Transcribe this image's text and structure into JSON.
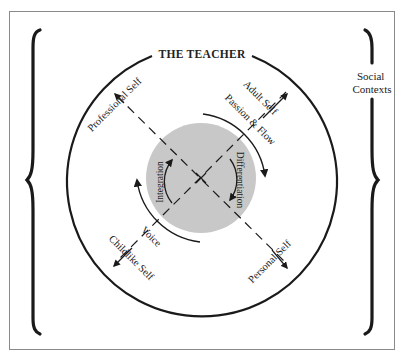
{
  "title": "THE TEACHER",
  "side_label": {
    "line1": "Social",
    "line2": "Contexts"
  },
  "axes": {
    "professional": "Professional Self",
    "adult": "Adult Self",
    "childlike": "Childlike Self",
    "personal": "Personal Self"
  },
  "arcs": {
    "passion_flow": "Passion & Flow",
    "voice": "Voice"
  },
  "core": {
    "integration": "Integration",
    "differentiation": "Differentiation"
  },
  "colors": {
    "ink": "#1a1a1a",
    "core_fill": "#c8c8c8",
    "frame": "#8a8a8a"
  }
}
